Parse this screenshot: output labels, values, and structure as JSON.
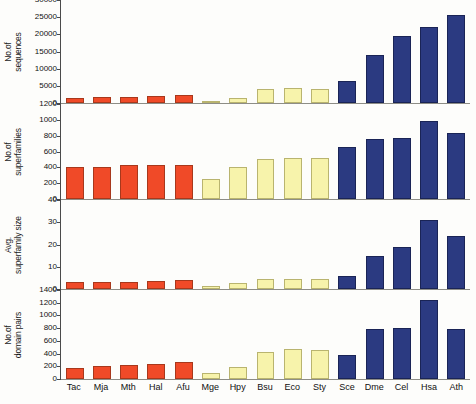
{
  "chart_data": {
    "type": "bar",
    "title": "",
    "xlabel": "",
    "grid": false,
    "legend": false,
    "categories": [
      "Tac",
      "Mja",
      "Mth",
      "Hal",
      "Afu",
      "Mge",
      "Hpy",
      "Bsu",
      "Eco",
      "Sty",
      "Sce",
      "Dme",
      "Cel",
      "Hsa",
      "Ath"
    ],
    "group_colors": {
      "archaea": "#f04a28",
      "bacteria": "#f7f3ab",
      "eukaryota": "#2b3a81"
    },
    "category_groups": [
      "archaea",
      "archaea",
      "archaea",
      "archaea",
      "archaea",
      "bacteria",
      "bacteria",
      "bacteria",
      "bacteria",
      "bacteria",
      "eukaryota",
      "eukaryota",
      "eukaryota",
      "eukaryota",
      "eukaryota"
    ],
    "panels": [
      {
        "ylabel": "No.of\nsequences",
        "ylabel_line1": "No.of",
        "ylabel_line2": "sequences",
        "ylim": [
          0,
          30000
        ],
        "ticks": [
          0,
          5000,
          10000,
          15000,
          20000,
          25000,
          30000
        ],
        "ticklabels": [
          "0",
          "5000",
          "10000",
          "15000",
          "20000",
          "25000",
          "30000"
        ],
        "values": [
          1500,
          1700,
          1850,
          2100,
          2400,
          480,
          1590,
          4100,
          4300,
          4200,
          6300,
          14000,
          19500,
          22000,
          25500
        ]
      },
      {
        "ylabel": "No.of\nsuperfamilies",
        "ylabel_line1": "No.of",
        "ylabel_line2": "superfamilies",
        "ylim": [
          0,
          1200
        ],
        "ticks": [
          0,
          200,
          400,
          600,
          800,
          1000,
          1200
        ],
        "ticklabels": [
          "0",
          "200",
          "400",
          "600",
          "800",
          "1000",
          "1200"
        ],
        "values": [
          410,
          405,
          425,
          430,
          435,
          250,
          410,
          510,
          520,
          520,
          660,
          760,
          770,
          980,
          840
        ]
      },
      {
        "ylabel": "Avg.\nsuperfamily size",
        "ylabel_line1": "Avg.",
        "ylabel_line2": "superfamily size",
        "ylim": [
          0,
          40
        ],
        "ticks": [
          0,
          10,
          20,
          30,
          40
        ],
        "ticklabels": [
          "0",
          "10",
          "20",
          "30",
          "40"
        ],
        "values": [
          3.0,
          3.2,
          3.3,
          3.4,
          3.9,
          1.5,
          2.5,
          4.5,
          4.6,
          4.6,
          6.0,
          15.0,
          19.0,
          31.0,
          24.0
        ]
      },
      {
        "ylabel": "No.of\ndomain pairs",
        "ylabel_line1": "No.of",
        "ylabel_line2": "domain pairs",
        "ylim": [
          0,
          1400
        ],
        "ticks": [
          0,
          200,
          400,
          600,
          800,
          1000,
          1200,
          1400
        ],
        "ticklabels": [
          "0",
          "200",
          "400",
          "600",
          "800",
          "1000",
          "1200",
          "1400"
        ],
        "values": [
          180,
          200,
          215,
          235,
          260,
          100,
          185,
          430,
          480,
          460,
          370,
          790,
          800,
          1250,
          790
        ]
      }
    ]
  }
}
